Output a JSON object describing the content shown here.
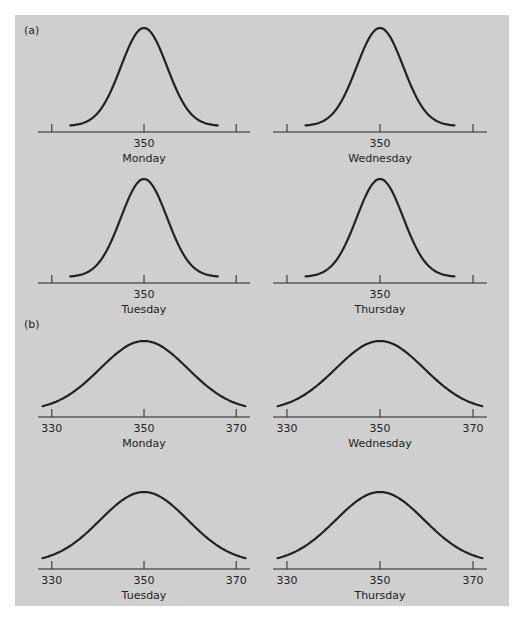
{
  "figure": {
    "background_color": "#cfcfcf",
    "ink_color": "#222222"
  },
  "chart_data": [
    {
      "type": "line",
      "part": "(a)",
      "title": "Monday",
      "xlabel": "Monday",
      "x_tick_labels": [
        "",
        "350",
        ""
      ],
      "x_ticks": [
        330,
        350,
        370
      ],
      "xlim": [
        327,
        373
      ],
      "distribution": {
        "shape": "normal",
        "mean": 350,
        "sd": 5
      },
      "curve_x_range": [
        334,
        366
      ]
    },
    {
      "type": "line",
      "part": "(a)",
      "title": "Wednesday",
      "xlabel": "Wednesday",
      "x_tick_labels": [
        "",
        "350",
        ""
      ],
      "x_ticks": [
        330,
        350,
        370
      ],
      "xlim": [
        327,
        373
      ],
      "distribution": {
        "shape": "normal",
        "mean": 350,
        "sd": 5
      },
      "curve_x_range": [
        334,
        366
      ]
    },
    {
      "type": "line",
      "part": "(a)",
      "title": "Tuesday",
      "xlabel": "Tuesday",
      "x_tick_labels": [
        "",
        "350",
        ""
      ],
      "x_ticks": [
        330,
        350,
        370
      ],
      "xlim": [
        327,
        373
      ],
      "distribution": {
        "shape": "normal",
        "mean": 350,
        "sd": 5
      },
      "curve_x_range": [
        334,
        366
      ]
    },
    {
      "type": "line",
      "part": "(a)",
      "title": "Thursday",
      "xlabel": "Thursday",
      "x_tick_labels": [
        "",
        "350",
        ""
      ],
      "x_ticks": [
        330,
        350,
        370
      ],
      "xlim": [
        327,
        373
      ],
      "distribution": {
        "shape": "normal",
        "mean": 350,
        "sd": 5
      },
      "curve_x_range": [
        334,
        366
      ]
    },
    {
      "type": "line",
      "part": "(b)",
      "title": "Monday",
      "xlabel": "Monday",
      "x_tick_labels": [
        "330",
        "350",
        "370"
      ],
      "x_ticks": [
        330,
        350,
        370
      ],
      "xlim": [
        327,
        373
      ],
      "distribution": {
        "shape": "normal",
        "mean": 350,
        "sd": 9.5
      },
      "curve_x_range": [
        328,
        372
      ]
    },
    {
      "type": "line",
      "part": "(b)",
      "title": "Wednesday",
      "xlabel": "Wednesday",
      "x_tick_labels": [
        "330",
        "350",
        "370"
      ],
      "x_ticks": [
        330,
        350,
        370
      ],
      "xlim": [
        327,
        373
      ],
      "distribution": {
        "shape": "normal",
        "mean": 350,
        "sd": 9.5
      },
      "curve_x_range": [
        328,
        372
      ]
    },
    {
      "type": "line",
      "part": "(b)",
      "title": "Tuesday",
      "xlabel": "Tuesday",
      "x_tick_labels": [
        "330",
        "350",
        "370"
      ],
      "x_ticks": [
        330,
        350,
        370
      ],
      "xlim": [
        327,
        373
      ],
      "distribution": {
        "shape": "normal",
        "mean": 350,
        "sd": 9.5
      },
      "curve_x_range": [
        328,
        372
      ]
    },
    {
      "type": "line",
      "part": "(b)",
      "title": "Thursday",
      "xlabel": "Thursday",
      "x_tick_labels": [
        "330",
        "350",
        "370"
      ],
      "x_ticks": [
        330,
        350,
        370
      ],
      "xlim": [
        327,
        373
      ],
      "distribution": {
        "shape": "normal",
        "mean": 350,
        "sd": 9.5
      },
      "curve_x_range": [
        328,
        372
      ]
    }
  ],
  "part_labels": [
    "(a)",
    "(b)"
  ]
}
